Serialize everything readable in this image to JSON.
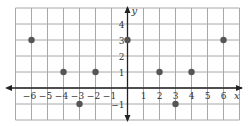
{
  "chart_data": {
    "type": "scatter",
    "title": "",
    "xlabel": "x",
    "ylabel": "y",
    "xlim": [
      -7,
      7
    ],
    "ylim": [
      -2,
      5
    ],
    "grid": true,
    "legend": null,
    "x_tick_labels": [
      "−6",
      "−5",
      "−4",
      "−3",
      "−2",
      "−1",
      "1",
      "2",
      "3",
      "4",
      "5",
      "6"
    ],
    "x_ticks": [
      -6,
      -5,
      -4,
      -3,
      -2,
      -1,
      1,
      2,
      3,
      4,
      5,
      6
    ],
    "y_tick_labels": [
      "4",
      "3",
      "2",
      "1",
      "−1"
    ],
    "y_ticks": [
      4,
      3,
      2,
      1,
      -1
    ],
    "series": [
      {
        "name": "points",
        "points": [
          {
            "x": -6,
            "y": 3
          },
          {
            "x": -4,
            "y": 1
          },
          {
            "x": -3,
            "y": -1
          },
          {
            "x": -2,
            "y": 1
          },
          {
            "x": 0,
            "y": 3
          },
          {
            "x": 2,
            "y": 1
          },
          {
            "x": 3,
            "y": -1
          },
          {
            "x": 4,
            "y": 1
          },
          {
            "x": 6,
            "y": 3
          }
        ]
      }
    ],
    "colors": {
      "grid": "#a8a8a8",
      "axis": "#222222",
      "point": "#555555",
      "text": "#333333"
    }
  }
}
